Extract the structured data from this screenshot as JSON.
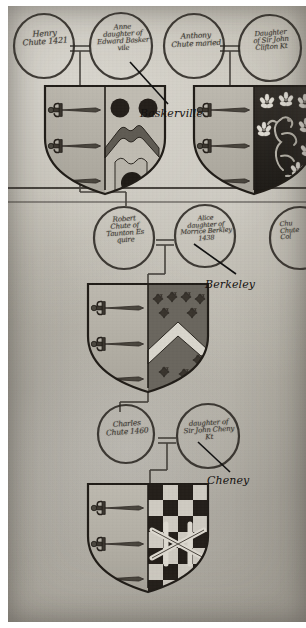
{
  "document": {
    "type": "heraldic-pedigree-chart",
    "title": "Chute family pedigree with marriage roundels and quartered arms",
    "medium": "aged manuscript / parchment photograph"
  },
  "roundels": [
    {
      "id": "henry-chute",
      "lines": [
        "Henry",
        "Chute 1421"
      ]
    },
    {
      "id": "anne-baskerville",
      "lines": [
        "Anne",
        "daughter of",
        "Edward Basker",
        "vile"
      ]
    },
    {
      "id": "anthony-chute",
      "lines": [
        "Anthony",
        "Chute maried"
      ]
    },
    {
      "id": "clifton-daughter",
      "lines": [
        "Daughter",
        "of Sir John",
        "Clifton Kt"
      ]
    },
    {
      "id": "robert-chute",
      "lines": [
        "Robert",
        "Chute of",
        "Taunton Es",
        "quire"
      ]
    },
    {
      "id": "alice-berkley",
      "lines": [
        "Alice",
        "daughter of",
        "Morrice Berkley",
        "1438"
      ]
    },
    {
      "id": "right-edge-roundel",
      "lines": [
        "Chu",
        "Chute",
        "Col"
      ]
    },
    {
      "id": "charles-chute",
      "lines": [
        "Charles",
        "Chute 1460"
      ]
    },
    {
      "id": "cheny-daughter",
      "lines": [
        "daughter of",
        "Sir John Cheny",
        "Kt"
      ]
    }
  ],
  "annotations": [
    {
      "id": "baskerville-label",
      "label": "Baskerville"
    },
    {
      "id": "berkeley-label",
      "label": "Berkeley"
    },
    {
      "id": "cheney-label",
      "label": "Cheney"
    }
  ],
  "shields": [
    {
      "id": "chute-impaling-baskerville",
      "dexter": "three swords in pale",
      "sinister": "two roundels in chief, a chevron, and a roundel in base"
    },
    {
      "id": "chute-impaling-clifton",
      "dexter": "three swords in pale",
      "sinister": "sable, a lion rampant between cinquefoils argent"
    },
    {
      "id": "chute-impaling-berkeley",
      "dexter": "three swords in pale",
      "sinister": "a chevron between ten crosses pattee"
    },
    {
      "id": "chute-impaling-cheney",
      "dexter": "three swords in pale",
      "sinister": "checky, a fret over all"
    }
  ],
  "palette": {
    "parchment": "#c2beb3",
    "ink": "#2b2722",
    "shield_field": "#b0aca1",
    "shield_dark": "#2a2722",
    "shield_mid": "#6e6a61",
    "shield_light": "#d8d5cc",
    "annotation_ink": "#141210",
    "page_background": "#ffffff"
  }
}
